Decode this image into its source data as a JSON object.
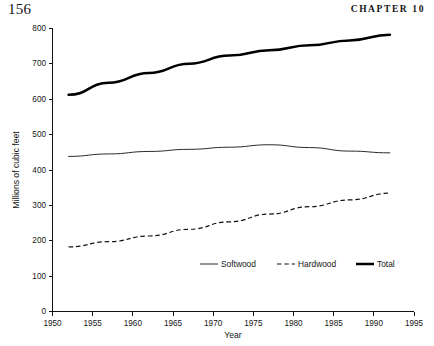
{
  "page": {
    "folio": "156",
    "running_head": "CHAPTER 10"
  },
  "chart_data": {
    "type": "line",
    "title": "",
    "xlabel": "Year",
    "ylabel": "Millions of cubic feet",
    "xlim": [
      1950,
      1995
    ],
    "ylim": [
      0,
      800
    ],
    "xticks": [
      1950,
      1955,
      1960,
      1965,
      1970,
      1975,
      1980,
      1985,
      1990,
      1995
    ],
    "xtick_labels": [
      "1950",
      "1955",
      "1960",
      "1965",
      "1970",
      "1975",
      "1980",
      "1985",
      "1990",
      "1995"
    ],
    "yticks": [
      0,
      100,
      200,
      300,
      400,
      500,
      600,
      700,
      800
    ],
    "ytick_labels": [
      "0",
      "100",
      "200",
      "300",
      "400",
      "500",
      "600",
      "700",
      "800"
    ],
    "grid": false,
    "legend_position": "lower center",
    "x": [
      1952,
      1957,
      1962,
      1967,
      1972,
      1977,
      1982,
      1987,
      1992
    ],
    "series": [
      {
        "name": "Softwood",
        "style": "solid-thin",
        "values": [
          437,
          444,
          451,
          457,
          463,
          470,
          462,
          452,
          447
        ]
      },
      {
        "name": "Hardwood",
        "style": "dashed",
        "values": [
          181,
          196,
          212,
          231,
          252,
          274,
          295,
          314,
          333
        ]
      },
      {
        "name": "Total",
        "style": "solid-thick",
        "values": [
          611,
          645,
          673,
          699,
          722,
          737,
          751,
          765,
          781
        ]
      }
    ]
  }
}
